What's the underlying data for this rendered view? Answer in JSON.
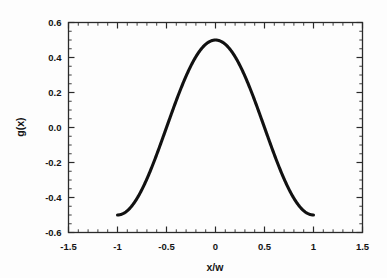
{
  "chart_data": {
    "type": "line",
    "title": "",
    "subtitle": "",
    "xlabel": "x/w",
    "ylabel": "g(x)",
    "xlim": [
      -1.5,
      1.5
    ],
    "ylim": [
      -0.6,
      0.6
    ],
    "grid": false,
    "legend": null,
    "legend_position": "none",
    "x_tick_labels": [
      "-1.5",
      "-1",
      "-0.5",
      "0",
      "0.5",
      "1",
      "1.5"
    ],
    "x_tick_values": [
      -1.5,
      -1,
      -0.5,
      0,
      0.5,
      1,
      1.5
    ],
    "x_minor_interval": 0.1,
    "y_tick_labels": [
      "0.6",
      "0.4",
      "0.2",
      "0.0",
      "-0.2",
      "-0.4",
      "-0.6"
    ],
    "y_tick_values": [
      0.6,
      0.4,
      0.2,
      0.0,
      -0.2,
      -0.4,
      -0.6
    ],
    "y_minor_interval": 0.05,
    "series": [
      {
        "name": "g(x)",
        "color": "#111111",
        "line_width": 3,
        "x": [
          -1.0,
          -0.975,
          -0.95,
          -0.925,
          -0.9,
          -0.875,
          -0.85,
          -0.825,
          -0.8,
          -0.775,
          -0.75,
          -0.725,
          -0.7,
          -0.675,
          -0.65,
          -0.625,
          -0.6,
          -0.575,
          -0.55,
          -0.525,
          -0.5,
          -0.475,
          -0.45,
          -0.425,
          -0.4,
          -0.375,
          -0.35,
          -0.325,
          -0.3,
          -0.275,
          -0.25,
          -0.225,
          -0.2,
          -0.175,
          -0.15,
          -0.125,
          -0.1,
          -0.075,
          -0.05,
          -0.025,
          0.0,
          0.025,
          0.05,
          0.075,
          0.1,
          0.125,
          0.15,
          0.175,
          0.2,
          0.225,
          0.25,
          0.275,
          0.3,
          0.325,
          0.35,
          0.375,
          0.4,
          0.425,
          0.45,
          0.475,
          0.5,
          0.525,
          0.55,
          0.575,
          0.6,
          0.625,
          0.65,
          0.675,
          0.7,
          0.725,
          0.75,
          0.775,
          0.8,
          0.825,
          0.85,
          0.875,
          0.9,
          0.925,
          0.95,
          0.975,
          1.0
        ],
        "y": [
          0.5,
          0.4992,
          0.4969,
          0.4931,
          0.4878,
          0.4809,
          0.4726,
          0.4628,
          0.4516,
          0.439,
          0.425,
          0.4097,
          0.3931,
          0.3753,
          0.3564,
          0.3363,
          0.3153,
          0.2933,
          0.2705,
          0.2468,
          0.2225,
          0.1975,
          0.172,
          0.1461,
          0.1198,
          0.0933,
          0.0666,
          0.0398,
          0.0129,
          -0.0139,
          -0.0406,
          -0.0672,
          -0.0934,
          -0.1193,
          -0.1448,
          -0.1699,
          -0.1943,
          -0.2182,
          -0.2413,
          -0.2637,
          -0.2853,
          -0.2637,
          -0.2413,
          -0.2182,
          -0.1943,
          -0.1699,
          -0.1448,
          -0.1193,
          -0.0934,
          -0.0672,
          -0.0406,
          -0.0139,
          0.0129,
          0.0398,
          0.0666,
          0.0933,
          0.1198,
          0.1461,
          0.172,
          0.1975,
          0.2225,
          0.2468,
          0.2705,
          0.2933,
          0.3153,
          0.3363,
          0.3564,
          0.3753,
          0.3931,
          0.4097,
          0.425,
          0.439,
          0.4516,
          0.4628,
          0.4726,
          0.4809,
          0.4878,
          0.4931,
          0.4969,
          0.4992,
          0.5
        ],
        "formula": "g(x) = 0.5*cos(pi*x/w)",
        "x_min": -1.0,
        "x_max": 1.0,
        "y_min": -0.5,
        "y_max": 0.5
      }
    ],
    "colors": {
      "curve": "#111111",
      "axis": "#2a2a2a",
      "text": "#141414",
      "background": "#fdfdfd"
    }
  }
}
